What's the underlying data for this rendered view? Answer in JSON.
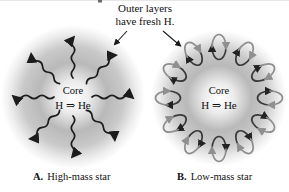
{
  "figure": {
    "annotation": {
      "line1": "Outer layers",
      "line2": "have fresh H."
    },
    "star_a": {
      "core_label": "Core",
      "reaction_label": "H ⇒ He",
      "caption_letter": "A.",
      "caption_text": "High-mass star"
    },
    "star_b": {
      "core_label": "Core",
      "reaction_label": "H ⇒ He",
      "caption_letter": "B.",
      "caption_text": "Low-mass star"
    },
    "colors": {
      "background": "#ffffff",
      "star_gray_mid": "#b9b9b9",
      "arrow_black": "#1c1c1c",
      "loop_dark": "#3a3a3a",
      "loop_gray": "#8f8f8f",
      "text": "#111111"
    }
  }
}
